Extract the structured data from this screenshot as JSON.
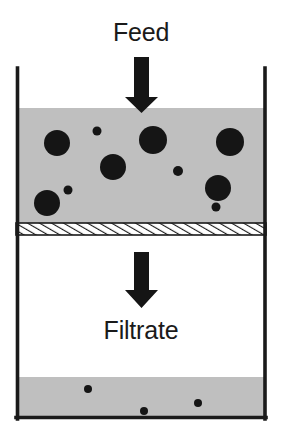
{
  "figure": {
    "type": "process-schematic",
    "title_visible": false,
    "width": 284,
    "height": 437,
    "background_color": "#ffffff"
  },
  "labels": {
    "feed": "Feed",
    "filtrate": "Filtrate"
  },
  "colors": {
    "stroke": "#1a1a1a",
    "slurry_fill": "#bfbfbf",
    "filtrate_fill": "#bfbfbf",
    "particle_fill": "#151515",
    "vessel_interior": "#ffffff",
    "membrane_fill": "#ffffff",
    "membrane_hatch": "#1a1a1a"
  },
  "vessel": {
    "left_wall_x": 16,
    "right_wall_x": 266,
    "top_y": 68,
    "bottom_y": 418,
    "wall_thickness": 4
  },
  "slurry_region": {
    "name": "feed-slurry",
    "top_y": 108,
    "bottom_y": 222,
    "fill": "#bfbfbf"
  },
  "membrane": {
    "name": "filter-medium",
    "top_y": 223,
    "bottom_y": 235,
    "hatch_spacing": 6,
    "hatch_angle_deg": 60
  },
  "filtrate_region": {
    "name": "collected-filtrate",
    "top_y": 377,
    "bottom_y": 418,
    "fill": "#bfbfbf"
  },
  "arrows": [
    {
      "name": "feed-arrow",
      "direction": "down",
      "shaft_x1": 134,
      "shaft_x2": 149,
      "shaft_y1": 57,
      "shaft_y2": 97,
      "head_x1": 125,
      "head_x2": 158,
      "tip_y": 113
    },
    {
      "name": "filtrate-arrow",
      "direction": "down",
      "shaft_x1": 134,
      "shaft_x2": 149,
      "shaft_y1": 252,
      "shaft_y2": 290,
      "head_x1": 125,
      "head_x2": 158,
      "tip_y": 308
    }
  ],
  "retained_particles": [
    {
      "cx": 57,
      "cy": 143,
      "r": 13
    },
    {
      "cx": 97,
      "cy": 131,
      "r": 4.5
    },
    {
      "cx": 113,
      "cy": 167,
      "r": 13
    },
    {
      "cx": 153,
      "cy": 140,
      "r": 14
    },
    {
      "cx": 230,
      "cy": 142,
      "r": 14
    },
    {
      "cx": 47,
      "cy": 203,
      "r": 13
    },
    {
      "cx": 68,
      "cy": 190,
      "r": 4.5
    },
    {
      "cx": 178,
      "cy": 171,
      "r": 5
    },
    {
      "cx": 218,
      "cy": 188,
      "r": 13
    },
    {
      "cx": 216,
      "cy": 207,
      "r": 4.5
    }
  ],
  "passed_particles": [
    {
      "cx": 88,
      "cy": 389,
      "r": 4
    },
    {
      "cx": 144,
      "cy": 411,
      "r": 4
    },
    {
      "cx": 198,
      "cy": 403,
      "r": 4
    }
  ]
}
